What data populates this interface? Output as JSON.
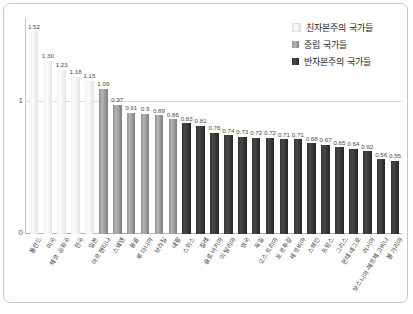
{
  "legend": {
    "position": "top-right",
    "entries": [
      {
        "label": "친자본주의 국가들",
        "swatch": "pro",
        "color": "#f2f2f2"
      },
      {
        "label": "중립 국가들",
        "swatch": "neutral",
        "color": "#9a9a9a"
      },
      {
        "label": "반자본주의 국가들",
        "swatch": "anti",
        "color": "#333333"
      }
    ]
  },
  "axis": {
    "y_ticks": [
      "1",
      "0"
    ],
    "y_tick_values": [
      1,
      0
    ]
  },
  "chart_data": {
    "type": "bar",
    "title": "",
    "xlabel": "",
    "ylabel": "",
    "ylim": [
      0,
      1.62
    ],
    "grid": true,
    "gridlines": [
      1
    ],
    "categories": [
      "폴란드",
      "미국",
      "체코 공화국",
      "한국",
      "일본",
      "아르헨티나",
      "스웨덴",
      "몽골",
      "루마니아",
      "브라질",
      "네팔",
      "스위스",
      "칠레",
      "슬로바키아",
      "이탈리아",
      "영국",
      "독일",
      "오스트리아",
      "포르투갈",
      "세르비아",
      "스페인",
      "프랑스",
      "그리스",
      "몬테네그로",
      "러시아",
      "보스니아-헤르체고비나",
      "불가리아"
    ],
    "values": [
      1.52,
      1.3,
      1.23,
      1.18,
      1.15,
      1.09,
      0.97,
      0.91,
      0.9,
      0.89,
      0.86,
      0.83,
      0.81,
      0.76,
      0.74,
      0.73,
      0.72,
      0.72,
      0.71,
      0.71,
      0.68,
      0.67,
      0.65,
      0.64,
      0.62,
      0.56,
      0.55
    ],
    "value_labels": [
      "1.52",
      "1.30",
      "1.23",
      "1.18",
      "1.15",
      "1.09",
      "0.97",
      "0.91",
      "0.9",
      "0.89",
      "0.86",
      "0.83",
      "0.81",
      "0.76",
      "0.74",
      "0.73",
      "0.72",
      "0.72",
      "0.71",
      "0.71",
      "0.68",
      "0.67",
      "0.65",
      "0.64",
      "0.62",
      "0.56",
      "0.55"
    ],
    "groups": [
      "pro",
      "pro",
      "pro",
      "pro",
      "pro",
      "neutral",
      "neutral",
      "neutral",
      "neutral",
      "neutral",
      "neutral",
      "anti",
      "anti",
      "anti",
      "anti",
      "anti",
      "anti",
      "anti",
      "anti",
      "anti",
      "anti",
      "anti",
      "anti",
      "anti",
      "anti",
      "anti",
      "anti"
    ]
  }
}
